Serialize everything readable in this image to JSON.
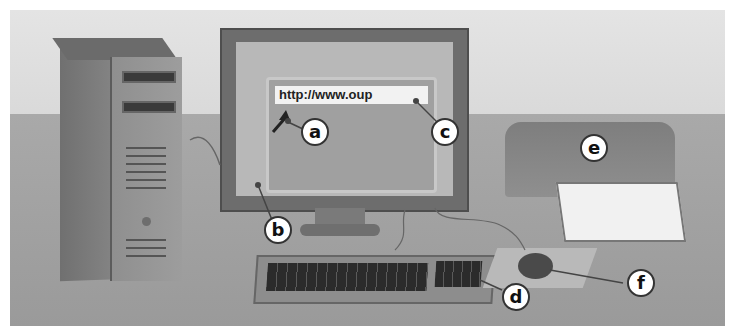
{
  "screen": {
    "url_text": "http://www.oup"
  },
  "labels": {
    "a": "a",
    "b": "b",
    "c": "c",
    "d": "d",
    "e": "e",
    "f": "f"
  },
  "components": [
    "system unit",
    "monitor",
    "keyboard",
    "mouse",
    "printer",
    "mouse pointer",
    "address bar"
  ],
  "colors": {
    "background": "#dcdcdc",
    "desk": "#a0a0a0",
    "label_fill": "#ffffff",
    "label_border": "#333333"
  }
}
